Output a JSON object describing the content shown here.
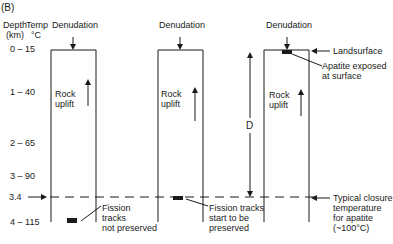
{
  "panel_label": "(B)",
  "axis": {
    "depth_header": "Depth",
    "depth_unit": "(km)",
    "temp_header": "Temp",
    "temp_unit": "°C",
    "rows": [
      {
        "depth": "0",
        "temp": "15"
      },
      {
        "depth": "1",
        "temp": "40"
      },
      {
        "depth": "2",
        "temp": "65"
      },
      {
        "depth": "3",
        "temp": "90"
      },
      {
        "depth": "3.4",
        "temp": ""
      },
      {
        "depth": "4",
        "temp": "115"
      }
    ],
    "dash": "–"
  },
  "columns": [
    {
      "top_label": "Denudation",
      "uplift_label_1": "Rock",
      "uplift_label_2": "uplift",
      "note": [
        "Fission",
        "tracks",
        "not preserved"
      ]
    },
    {
      "top_label": "Denudation",
      "uplift_label_1": "Rock",
      "uplift_label_2": "uplift",
      "note": [
        "Fission tracks",
        "start to be",
        "preserved"
      ]
    },
    {
      "top_label": "Denudation",
      "uplift_label_1": "Rock",
      "uplift_label_2": "uplift",
      "note": [
        "Apatite exposed",
        "at surface"
      ]
    }
  ],
  "distance_label": "D",
  "landsurface_label": "Landsurface",
  "closure_label": [
    "Typical closure",
    "temperature",
    "for apatite",
    "(~100°C)"
  ],
  "colors": {
    "line": "#1a1a1a",
    "background": "#ffffff"
  }
}
